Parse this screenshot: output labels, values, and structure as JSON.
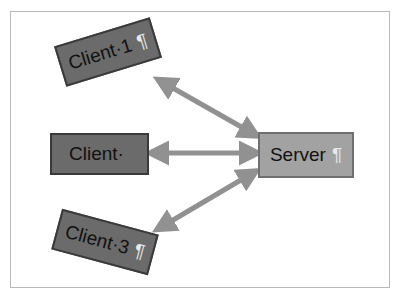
{
  "diagram": {
    "background_color": "#ffffff",
    "frame_color": "#b9b9b9",
    "nodes": [
      {
        "id": "client-1",
        "label": "Client·1",
        "mark": "¶",
        "shape": "rectangle",
        "fill": "#6b6b6b",
        "border": "#3a3a3a",
        "text_color": "#111111",
        "rotation_deg": -17
      },
      {
        "id": "client-2",
        "label": "Client·",
        "mark": "",
        "shape": "rectangle",
        "fill": "#6b6b6b",
        "border": "#3a3a3a",
        "text_color": "#111111",
        "rotation_deg": 0
      },
      {
        "id": "client-3",
        "label": "Client·3",
        "mark": "¶",
        "shape": "rectangle",
        "fill": "#6b6b6b",
        "border": "#3a3a3a",
        "text_color": "#111111",
        "rotation_deg": 15
      },
      {
        "id": "server",
        "label": "Server",
        "mark": "¶",
        "shape": "rectangle",
        "fill": "#a2a2a2",
        "border": "#6f6f6f",
        "text_color": "#111111",
        "rotation_deg": 0
      }
    ],
    "connectors": [
      {
        "id": "client-1-server",
        "from": "client-1",
        "to": "server",
        "style": "double-headed-arrow",
        "color": "#919191"
      },
      {
        "id": "client-2-server",
        "from": "client-2",
        "to": "server",
        "style": "double-headed-arrow",
        "color": "#919191"
      },
      {
        "id": "client-3-server",
        "from": "client-3",
        "to": "server",
        "style": "double-headed-arrow",
        "color": "#919191"
      }
    ]
  }
}
